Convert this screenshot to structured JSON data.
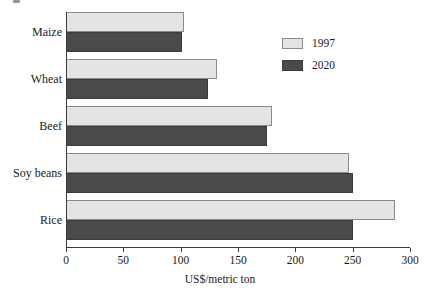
{
  "chart_data": {
    "type": "bar",
    "orientation": "horizontal",
    "title": "",
    "subtitle": "",
    "xlabel": "US$/metric ton",
    "ylabel": "",
    "categories": [
      "Maize",
      "Wheat",
      "Beef",
      "Soy beans",
      "Rice"
    ],
    "series": [
      {
        "name": "1997",
        "color": "#e4e4e4",
        "values": [
          103,
          132,
          180,
          247,
          287
        ]
      },
      {
        "name": "2020",
        "color": "#4a4a4a",
        "values": [
          101,
          124,
          175,
          250,
          250
        ]
      }
    ],
    "xlim": [
      0,
      300
    ],
    "xticks": [
      0,
      50,
      100,
      150,
      200,
      250,
      300
    ],
    "xtick_labels": [
      "0",
      "50",
      "100",
      "150",
      "200",
      "250",
      "300"
    ],
    "grid": false,
    "legend_position": "top-right",
    "legend_entries": [
      "1997",
      "2020"
    ]
  },
  "axis": {
    "x_title": "US$/metric ton"
  },
  "legend": {
    "items": [
      {
        "label": "1997",
        "swatch": "light-gray-swatch"
      },
      {
        "label": "2020",
        "swatch": "dark-gray-swatch"
      }
    ]
  },
  "colors": {
    "series_1997": "#e4e4e4",
    "series_2020": "#4a4a4a",
    "bar_outline": "#8b8b8b",
    "axis": "#3a3a3a",
    "text": "#1a1a1a",
    "background": "#ffffff"
  }
}
